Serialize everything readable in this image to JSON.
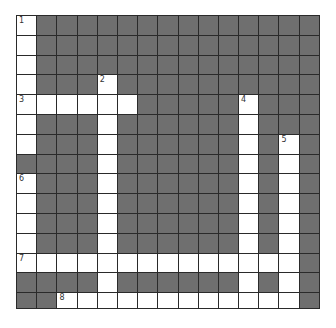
{
  "puzzle": {
    "cols": 15,
    "rows": 15,
    "colors": {
      "block": "#6f6f6f",
      "open": "#ffffff",
      "grid_line": "#2a2a2a",
      "number": "#333333"
    },
    "layout": [
      "W..............",
      "W..............",
      "W..............",
      "W...W..........",
      "WWWWWW.....W...",
      "W...W......W...",
      "W...W......W.W.",
      "....W......W.W.",
      "W...W......W.W.",
      "W...W......W.W.",
      "W...W......W.W.",
      "W...W......W.W.",
      "WWWWWWWWWWWWWW.",
      "....W......W.W.",
      "..WWWWWWWWWWWW."
    ],
    "numbers": [
      {
        "label": "1",
        "row": 0,
        "col": 0
      },
      {
        "label": "2",
        "row": 3,
        "col": 4
      },
      {
        "label": "3",
        "row": 4,
        "col": 0
      },
      {
        "label": "4",
        "row": 4,
        "col": 11
      },
      {
        "label": "5",
        "row": 6,
        "col": 13
      },
      {
        "label": "6",
        "row": 8,
        "col": 0
      },
      {
        "label": "7",
        "row": 12,
        "col": 0
      },
      {
        "label": "8",
        "row": 14,
        "col": 2
      }
    ],
    "entries": {
      "across": [
        {
          "number": "3",
          "row": 4,
          "col": 0,
          "length": 6
        },
        {
          "number": "7",
          "row": 12,
          "col": 0,
          "length": 14
        },
        {
          "number": "8",
          "row": 14,
          "col": 2,
          "length": 12
        }
      ],
      "down": [
        {
          "number": "1",
          "row": 0,
          "col": 0,
          "length": 7
        },
        {
          "number": "2",
          "row": 3,
          "col": 4,
          "length": 12
        },
        {
          "number": "4",
          "row": 4,
          "col": 11,
          "length": 11
        },
        {
          "number": "5",
          "row": 6,
          "col": 13,
          "length": 9
        },
        {
          "number": "6",
          "row": 8,
          "col": 0,
          "length": 5
        }
      ]
    }
  }
}
